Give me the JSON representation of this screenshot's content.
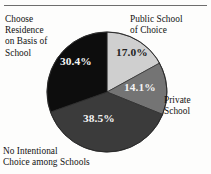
{
  "figure": {
    "has_top_rule": true,
    "background_color": "#fdfdfc"
  },
  "labels": {
    "residence": "Choose\nResidence\non Basis of\nSchool",
    "public_school": "Public School\nof Choice",
    "private_school": "Private\nSchool",
    "no_intentional": "No Intentional\nChoice among Schools"
  },
  "values": {
    "public_school": "17.0%",
    "private_school": "14.1%",
    "no_intentional": "38.5%",
    "residence": "30.4%"
  },
  "chart_data": {
    "type": "pie",
    "title": "",
    "subtitle": "",
    "xlabel": "",
    "ylabel": "",
    "legend_position": "outside-callout-labels",
    "grid": false,
    "start_angle_deg": 0,
    "direction": "clockwise",
    "categories": [
      "Public School of Choice",
      "Private School",
      "No Intentional Choice among Schools",
      "Choose Residence on Basis of School"
    ],
    "values": [
      17.0,
      14.1,
      38.5,
      30.4
    ],
    "value_labels": [
      "17.0%",
      "14.1%",
      "38.5%",
      "30.4%"
    ],
    "colors": [
      "#cfcfcf",
      "#747474",
      "#3b3b3b",
      "#0d0d0d"
    ],
    "label_text_colors": [
      "#232323",
      "#f2f2f2",
      "#f4f4f4",
      "#f4f4f4"
    ],
    "total": 100.0,
    "units": "percent"
  }
}
